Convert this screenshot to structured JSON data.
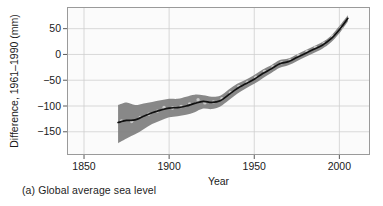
{
  "figure": {
    "caption": "(a) Global average sea level"
  },
  "chart_data": {
    "type": "line",
    "title": "",
    "subtitle": "",
    "xlabel": "Year",
    "ylabel": "Difference, 1961–1990 (mm)",
    "xlim": [
      1840,
      2018
    ],
    "ylim": [
      -195,
      92
    ],
    "xticks": [
      1850,
      1900,
      1950,
      2000
    ],
    "xticklabels": [
      "1850",
      "1900",
      "1950",
      "2000"
    ],
    "yticks": [
      50,
      0,
      -50,
      -100,
      -150
    ],
    "yticklabels": [
      "50",
      "0",
      "−50",
      "−100",
      "−150"
    ],
    "grid": true,
    "grid_color": "#cfcfcf",
    "legend": "none",
    "plot_bg": "#fbfbfb",
    "frame_color": "#9a9a9a",
    "band_color": "#7e7e7e",
    "line_color": "#101010",
    "marker_color": "#c9c9c9",
    "series": [
      {
        "name": "Global average sea level (smoothed)",
        "x": [
          1870,
          1875,
          1880,
          1885,
          1890,
          1895,
          1900,
          1905,
          1910,
          1915,
          1920,
          1925,
          1930,
          1935,
          1940,
          1945,
          1950,
          1955,
          1960,
          1965,
          1970,
          1975,
          1980,
          1985,
          1990,
          1995,
          2000,
          2005
        ],
        "values": [
          -132,
          -128,
          -127,
          -120,
          -113,
          -108,
          -104,
          -103,
          -100,
          -95,
          -91,
          -93,
          -90,
          -78,
          -66,
          -57,
          -48,
          -37,
          -28,
          -18,
          -14,
          -6,
          2,
          10,
          18,
          30,
          48,
          70
        ]
      },
      {
        "name": "Uncertainty band upper",
        "x": [
          1870,
          1875,
          1880,
          1885,
          1890,
          1895,
          1900,
          1905,
          1910,
          1915,
          1920,
          1925,
          1930,
          1935,
          1940,
          1945,
          1950,
          1955,
          1960,
          1965,
          1970,
          1975,
          1980,
          1985,
          1990,
          1995,
          2000,
          2005
        ],
        "values": [
          -98,
          -93,
          -98,
          -95,
          -92,
          -89,
          -86,
          -86,
          -82,
          -78,
          -79,
          -82,
          -80,
          -68,
          -57,
          -49,
          -40,
          -29,
          -21,
          -11,
          -8,
          0,
          8,
          16,
          24,
          36,
          55,
          76
        ]
      },
      {
        "name": "Uncertainty band lower",
        "x": [
          1870,
          1875,
          1880,
          1885,
          1890,
          1895,
          1900,
          1905,
          1910,
          1915,
          1920,
          1925,
          1930,
          1935,
          1940,
          1945,
          1950,
          1955,
          1960,
          1965,
          1970,
          1975,
          1980,
          1985,
          1990,
          1995,
          2000,
          2005
        ],
        "values": [
          -172,
          -163,
          -155,
          -145,
          -135,
          -128,
          -122,
          -120,
          -117,
          -112,
          -105,
          -106,
          -101,
          -89,
          -76,
          -66,
          -57,
          -46,
          -36,
          -26,
          -21,
          -13,
          -5,
          3,
          11,
          23,
          41,
          64
        ]
      },
      {
        "name": "Annual observations",
        "x": [
          1872,
          1878,
          1883,
          1888,
          1893,
          1897,
          1902,
          1907,
          1912,
          1917,
          1921,
          1926,
          1931,
          1936,
          1941,
          1946,
          1951,
          1956,
          1961,
          1966,
          1971,
          1976,
          1981,
          1986,
          1991,
          1996,
          2001
        ],
        "values": [
          -129,
          -130,
          -122,
          -116,
          -110,
          -103,
          -104,
          -101,
          -96,
          -88,
          -94,
          -92,
          -86,
          -74,
          -62,
          -54,
          -44,
          -33,
          -24,
          -16,
          -11,
          -2,
          6,
          14,
          22,
          36,
          52
        ]
      }
    ]
  }
}
